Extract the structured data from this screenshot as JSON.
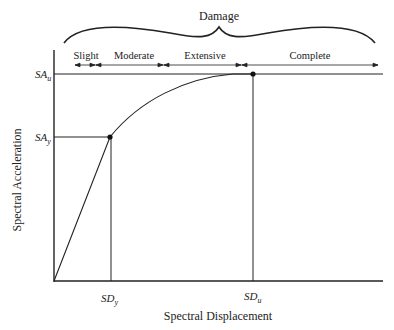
{
  "diagram": {
    "type": "capacity-curve",
    "brace_label": "Damage",
    "damage_states": [
      {
        "label": "Slight"
      },
      {
        "label": "Moderate"
      },
      {
        "label": "Extensive"
      },
      {
        "label": "Complete"
      }
    ],
    "y_axis": {
      "label": "Spectral Acceleration",
      "ticks": [
        {
          "main": "SA",
          "sub": "u"
        },
        {
          "main": "SA",
          "sub": "y"
        }
      ]
    },
    "x_axis": {
      "label": "Spectral Displacement",
      "ticks": [
        {
          "main": "SD",
          "sub": "y"
        },
        {
          "main": "SD",
          "sub": "u"
        }
      ]
    },
    "points": [
      {
        "name": "yield",
        "x_label": "SDy",
        "y_label": "SAy"
      },
      {
        "name": "ultimate",
        "x_label": "SDu",
        "y_label": "SAu"
      }
    ],
    "colors": {
      "line": "#222222",
      "background": "#ffffff"
    }
  }
}
